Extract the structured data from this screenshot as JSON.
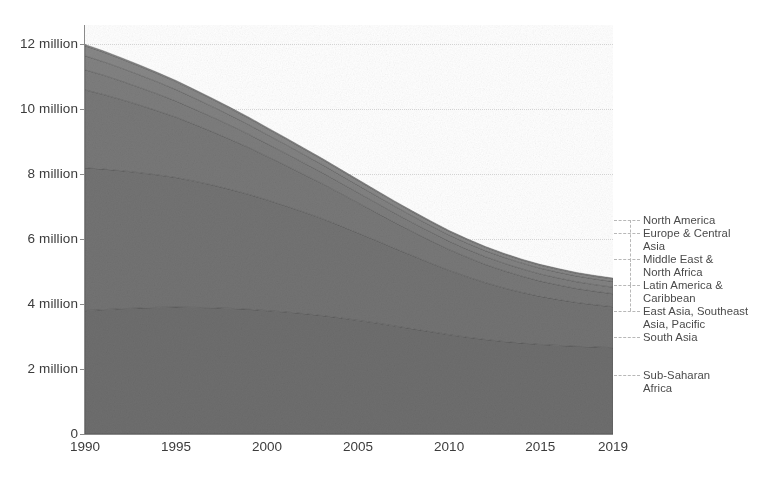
{
  "chart_data": {
    "type": "area",
    "stacked": true,
    "title": "",
    "subtitle": "",
    "xlabel": "",
    "ylabel": "",
    "x": [
      1990,
      1991,
      1992,
      1993,
      1994,
      1995,
      1996,
      1997,
      1998,
      1999,
      2000,
      2001,
      2002,
      2003,
      2004,
      2005,
      2006,
      2007,
      2008,
      2009,
      2010,
      2011,
      2012,
      2013,
      2014,
      2015,
      2016,
      2017,
      2018,
      2019
    ],
    "xlim": [
      1990,
      2019
    ],
    "ylim": [
      0,
      12600000
    ],
    "xticks": [
      1990,
      1995,
      2000,
      2005,
      2010,
      2015,
      2019
    ],
    "xtick_labels": [
      "1990",
      "1995",
      "2000",
      "2005",
      "2010",
      "2015",
      "2019"
    ],
    "yticks": [
      0,
      2000000,
      4000000,
      6000000,
      8000000,
      10000000,
      12000000
    ],
    "ytick_labels": [
      "0",
      "2 million",
      "4 million",
      "6 million",
      "8 million",
      "10 million",
      "12 million"
    ],
    "grid": true,
    "grid_style": "dotted-horizontal",
    "legend_position": "right-outside",
    "series": [
      {
        "name": "Sub-Saharan Africa",
        "color": "#6e6e6e",
        "values": [
          3800000,
          3830000,
          3860000,
          3880000,
          3900000,
          3910000,
          3900000,
          3890000,
          3870000,
          3840000,
          3800000,
          3760000,
          3710000,
          3650000,
          3580000,
          3500000,
          3420000,
          3330000,
          3240000,
          3150000,
          3060000,
          2980000,
          2910000,
          2850000,
          2800000,
          2760000,
          2730000,
          2700000,
          2680000,
          2660000
        ]
      },
      {
        "name": "South Asia",
        "color": "#737373",
        "values": [
          4400000,
          4330000,
          4250000,
          4170000,
          4080000,
          3990000,
          3890000,
          3780000,
          3660000,
          3540000,
          3410000,
          3270000,
          3130000,
          2990000,
          2840000,
          2690000,
          2540000,
          2390000,
          2250000,
          2110000,
          1980000,
          1860000,
          1750000,
          1650000,
          1560000,
          1480000,
          1410000,
          1350000,
          1300000,
          1260000
        ]
      },
      {
        "name": "East Asia, Southeast Asia, Pacific",
        "color": "#787878",
        "values": [
          2400000,
          2300000,
          2190000,
          2080000,
          1970000,
          1860000,
          1750000,
          1640000,
          1540000,
          1440000,
          1340000,
          1250000,
          1160000,
          1080000,
          1000000,
          930000,
          860000,
          800000,
          740000,
          690000,
          640000,
          600000,
          560000,
          530000,
          500000,
          470000,
          450000,
          430000,
          415000,
          400000
        ]
      },
      {
        "name": "Latin America & Caribbean",
        "color": "#7d7d7d",
        "values": [
          620000,
          595000,
          570000,
          545000,
          520000,
          495000,
          470000,
          450000,
          430000,
          410000,
          390000,
          372000,
          355000,
          340000,
          326000,
          312000,
          299000,
          287000,
          276000,
          266000,
          256000,
          248000,
          240000,
          233000,
          226000,
          220000,
          215000,
          210000,
          206000,
          202000
        ]
      },
      {
        "name": "Middle East & North Africa",
        "color": "#828282",
        "values": [
          430000,
          415000,
          400000,
          385000,
          370000,
          355000,
          340000,
          325000,
          310000,
          296000,
          282000,
          270000,
          258000,
          247000,
          237000,
          228000,
          219000,
          211000,
          204000,
          198000,
          192000,
          187000,
          183000,
          180000,
          178000,
          177000,
          176000,
          175000,
          174000,
          173000
        ]
      },
      {
        "name": "Europe & Central Asia",
        "color": "#878787",
        "values": [
          310000,
          296000,
          283000,
          270000,
          257000,
          245000,
          233000,
          222000,
          211000,
          200000,
          190000,
          181000,
          172000,
          163000,
          155000,
          147000,
          140000,
          133000,
          127000,
          121000,
          115000,
          110000,
          105000,
          100000,
          96000,
          92000,
          89000,
          86000,
          84000,
          82000
        ]
      },
      {
        "name": "North America",
        "color": "#8c8c8c",
        "values": [
          42000,
          41000,
          40000,
          39000,
          38000,
          37000,
          36000,
          35500,
          35000,
          34500,
          34000,
          33500,
          33000,
          32500,
          32000,
          31500,
          31000,
          30500,
          30000,
          29500,
          29000,
          28500,
          28000,
          27500,
          27000,
          26800,
          26600,
          26400,
          26200,
          26000
        ]
      }
    ],
    "totals": [
      12002000,
      11807000,
      11593000,
      11367000,
      11135000,
      10892000,
      10619000,
      10342000,
      10056000,
      9760000,
      9446000,
      9136000,
      8818000,
      8492000,
      8161000,
      7818000,
      7489000,
      7181000,
      6867000,
      6564000,
      6272000,
      6013000,
      5778000,
      5570000,
      5386000,
      5225000,
      5096000,
      4977000,
      4885000,
      4803000
    ]
  },
  "legend": {
    "items": [
      {
        "label": "North America",
        "anchor_y": 220
      },
      {
        "label": "Europe & Central\nAsia",
        "anchor_y": 233
      },
      {
        "label": "Middle East &\nNorth Africa",
        "anchor_y": 259
      },
      {
        "label": "Latin America &\nCaribbean",
        "anchor_y": 285
      },
      {
        "label": "East Asia, Southeast\nAsia, Pacific",
        "anchor_y": 311
      },
      {
        "label": "South Asia",
        "anchor_y": 337
      },
      {
        "label": "Sub-Saharan\nAfrica",
        "anchor_y": 375
      }
    ]
  },
  "colors": {
    "axis": "#8a8a8a",
    "grid": "#d9d9d9",
    "text": "#3c3c3c",
    "legend_text": "#4a4a4a",
    "leader": "#b8b8b8",
    "background": "#ffffff"
  }
}
